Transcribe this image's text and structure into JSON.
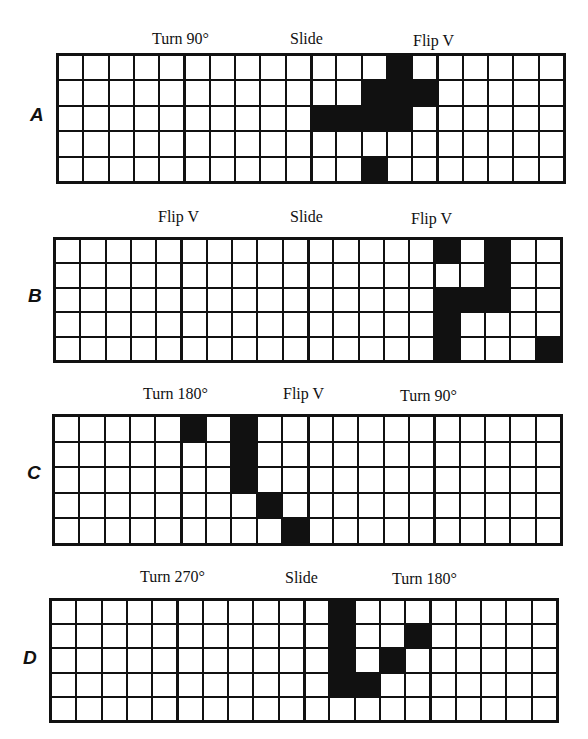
{
  "rows": [
    {
      "label": "A",
      "transformations": [
        "Turn 90°",
        "Slide",
        "Flip V"
      ],
      "grid": {
        "cols": 20,
        "rows": 5,
        "block_size": 5,
        "filled": [
          [
            0,
            13
          ],
          [
            1,
            12
          ],
          [
            1,
            13
          ],
          [
            1,
            14
          ],
          [
            2,
            10
          ],
          [
            2,
            11
          ],
          [
            2,
            12
          ],
          [
            2,
            13
          ],
          [
            4,
            12
          ]
        ]
      }
    },
    {
      "label": "B",
      "transformations": [
        "Flip V",
        "Slide",
        "Flip V"
      ],
      "grid": {
        "cols": 20,
        "rows": 5,
        "block_size": 5,
        "filled": [
          [
            0,
            15
          ],
          [
            0,
            17
          ],
          [
            1,
            17
          ],
          [
            2,
            15
          ],
          [
            2,
            16
          ],
          [
            2,
            17
          ],
          [
            3,
            15
          ],
          [
            4,
            15
          ],
          [
            4,
            19
          ]
        ]
      }
    },
    {
      "label": "C",
      "transformations": [
        "Turn 180°",
        "Flip V",
        "Turn 90°"
      ],
      "grid": {
        "cols": 20,
        "rows": 5,
        "block_size": 5,
        "filled": [
          [
            0,
            5
          ],
          [
            0,
            7
          ],
          [
            1,
            7
          ],
          [
            2,
            7
          ],
          [
            3,
            8
          ],
          [
            4,
            9
          ]
        ]
      }
    },
    {
      "label": "D",
      "transformations": [
        "Turn 270°",
        "Slide",
        "Turn 180°"
      ],
      "grid": {
        "cols": 20,
        "rows": 5,
        "block_size": 5,
        "filled": [
          [
            0,
            11
          ],
          [
            1,
            11
          ],
          [
            1,
            14
          ],
          [
            2,
            11
          ],
          [
            2,
            13
          ],
          [
            3,
            11
          ],
          [
            3,
            12
          ]
        ]
      }
    }
  ],
  "colors": {
    "filled": "#111111",
    "empty": "#ffffff",
    "line": "#111111"
  }
}
